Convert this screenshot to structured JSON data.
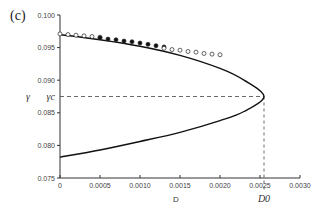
{
  "chart_data": {
    "type": "line",
    "panel_label": "(c)",
    "title": "",
    "xlabel": "D",
    "ylabel": "γ",
    "xlim": [
      0,
      0.003
    ],
    "ylim": [
      0.075,
      0.1
    ],
    "x_ticks": [
      "0",
      "0.0005",
      "0.0010",
      "0.0015",
      "0.0020",
      "0.0025",
      "0.0030"
    ],
    "y_ticks": [
      "0.075",
      "0.080",
      "0.085",
      "0.090",
      "0.095",
      "0.100"
    ],
    "grid": false,
    "annotations": {
      "gamma_c_label": "γc",
      "gamma_c_value": 0.0875,
      "D0_label": "D0",
      "D0_value": 0.00255
    },
    "series": [
      {
        "name": "theory curve",
        "style": "solid line",
        "x": [
          0,
          0.0005,
          0.001,
          0.0015,
          0.002,
          0.0023,
          0.00255,
          0.0023,
          0.002,
          0.0015,
          0.001,
          0.0005,
          0
        ],
        "y": [
          0.097,
          0.0962,
          0.0952,
          0.0938,
          0.0918,
          0.09,
          0.0875,
          0.0852,
          0.0838,
          0.082,
          0.0806,
          0.0793,
          0.0782
        ]
      },
      {
        "name": "open circles (left)",
        "style": "open circle markers",
        "x": [
          0,
          0.0001,
          0.0002,
          0.0003,
          0.0004,
          0.0005
        ],
        "y": [
          0.0971,
          0.097,
          0.0969,
          0.0968,
          0.0967,
          0.0966
        ]
      },
      {
        "name": "filled circles",
        "style": "filled circle markers",
        "x": [
          0.0005,
          0.0006,
          0.0007,
          0.0008,
          0.0009,
          0.001,
          0.0011,
          0.0012,
          0.0013
        ],
        "y": [
          0.0965,
          0.0963,
          0.0962,
          0.096,
          0.0959,
          0.0957,
          0.0955,
          0.0953,
          0.0951
        ]
      },
      {
        "name": "open circles (right)",
        "style": "open circle markers",
        "x": [
          0.0013,
          0.0014,
          0.0015,
          0.0016,
          0.0017,
          0.0018,
          0.0019,
          0.002
        ],
        "y": [
          0.0949,
          0.0947,
          0.0946,
          0.0944,
          0.0943,
          0.0941,
          0.094,
          0.0939
        ]
      }
    ]
  }
}
